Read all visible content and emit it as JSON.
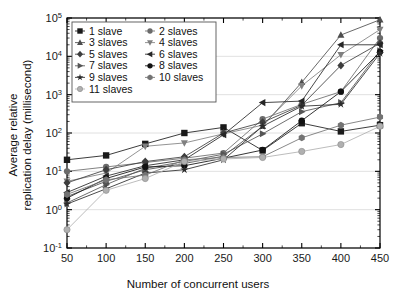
{
  "chart_data": {
    "type": "line",
    "title": "",
    "xlabel": "Number of concurrent users",
    "ylabel": "Average relative replication delay (millisecond)",
    "ylabel_line1": "Average relative",
    "ylabel_line2": "replication delay (millisecond)",
    "x": [
      50,
      100,
      150,
      200,
      250,
      300,
      350,
      400,
      450
    ],
    "xticks": [
      "50",
      "100",
      "150",
      "200",
      "250",
      "300",
      "350",
      "400",
      "450"
    ],
    "xlim": [
      50,
      450
    ],
    "ylim": [
      0.1,
      100000
    ],
    "yscale": "log",
    "yticks": [
      0.1,
      1,
      10,
      100,
      1000,
      10000,
      100000
    ],
    "ytick_labels": [
      "10⁻¹",
      "10⁰",
      "10¹",
      "10²",
      "10³",
      "10⁴",
      "10⁵"
    ],
    "ytick_mantissa": [
      "10",
      "10",
      "10",
      "10",
      "10",
      "10",
      "10"
    ],
    "ytick_exponent": [
      "-1",
      "0",
      "1",
      "2",
      "3",
      "4",
      "5"
    ],
    "grid": true,
    "grid_axis": "y",
    "legend_position": "upper-left-inside",
    "legend_columns": 2,
    "series": [
      {
        "name": "1 slave",
        "marker": "square",
        "color": "#1a1a1a",
        "values": [
          20,
          26,
          52,
          100,
          140,
          35,
          180,
          110,
          160
        ]
      },
      {
        "name": "2 slaves",
        "marker": "circle",
        "color": "#6b6b6b",
        "values": [
          10,
          13,
          17,
          22,
          30,
          230,
          560,
          1200,
          30000
        ]
      },
      {
        "name": "3 slaves",
        "marker": "triangle-up",
        "color": "#4d4d4d",
        "values": [
          2.2,
          5.5,
          11,
          16,
          25,
          150,
          2100,
          36000,
          90000
        ]
      },
      {
        "name": "4 slaves",
        "marker": "triangle-down",
        "color": "#808080",
        "values": [
          5.5,
          9,
          45,
          55,
          95,
          160,
          1700,
          11000,
          50000
        ]
      },
      {
        "name": "5 slaves",
        "marker": "diamond",
        "color": "#3d3d3d",
        "values": [
          5.0,
          11,
          18,
          24,
          100,
          190,
          530,
          5800,
          22000
        ]
      },
      {
        "name": "6 slaves",
        "marker": "triangle-left",
        "color": "#262626",
        "values": [
          2.8,
          7.5,
          14,
          20,
          90,
          620,
          680,
          20000,
          20000
        ]
      },
      {
        "name": "7 slaves",
        "marker": "triangle-right",
        "color": "#555555",
        "values": [
          1.5,
          4.5,
          12,
          18,
          28,
          95,
          360,
          620,
          14000
        ]
      },
      {
        "name": "8 slaves",
        "marker": "circle-filled",
        "color": "#111111",
        "values": [
          2.0,
          6.5,
          13,
          14,
          22,
          36,
          210,
          1200,
          13000
        ]
      },
      {
        "name": "9 slaves",
        "marker": "star",
        "color": "#2b2b2b",
        "values": [
          1.4,
          3.5,
          9,
          11,
          20,
          150,
          500,
          560,
          12000
        ]
      },
      {
        "name": "10 slaves",
        "marker": "hexagon",
        "color": "#737373",
        "values": [
          2.5,
          6.0,
          8,
          20,
          23,
          24,
          75,
          160,
          260
        ]
      },
      {
        "name": "11 slaves",
        "marker": "circle-light",
        "color": "#b0b0b0",
        "values": [
          0.3,
          3.2,
          6.5,
          18,
          21,
          23,
          33,
          50,
          150
        ]
      }
    ]
  },
  "legend": {
    "entries": [
      {
        "label": "1 slave"
      },
      {
        "label": "2 slaves"
      },
      {
        "label": "3 slaves"
      },
      {
        "label": "4 slaves"
      },
      {
        "label": "5 slaves"
      },
      {
        "label": "6 slaves"
      },
      {
        "label": "7 slaves"
      },
      {
        "label": "8 slaves"
      },
      {
        "label": "9 slaves"
      },
      {
        "label": "10 slaves"
      },
      {
        "label": "11 slaves"
      }
    ]
  },
  "colors": {
    "axis": "#000000",
    "grid": "#d8d8d8",
    "background": "#ffffff",
    "text": "#111111"
  }
}
